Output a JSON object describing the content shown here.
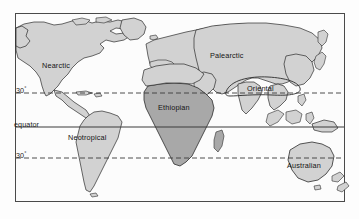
{
  "figure": {
    "kind": "world-map",
    "frame": {
      "x": 15,
      "y": 13,
      "width": 330,
      "height": 189
    }
  },
  "colors": {
    "page_background": "#ffffff",
    "frame_border": "#4a4a4a",
    "ocean": "#fcfcfc",
    "land_light": "#d2d2d2",
    "land_dark": "#a8a8a8",
    "coastline": "#2b2b2b",
    "latitude_line": "#3a3a3a",
    "equator_line": "#3a3a3a",
    "label_text": "#151515"
  },
  "latitude_lines": [
    {
      "id": "north-30",
      "label": "30",
      "degree_symbol": "°",
      "style": "dashed",
      "y": 93
    },
    {
      "id": "equator",
      "label": "equator",
      "degree_symbol": "",
      "style": "solid",
      "y": 127
    },
    {
      "id": "south-30",
      "label": "30",
      "degree_symbol": "°",
      "style": "dashed",
      "y": 158
    }
  ],
  "regions": [
    {
      "id": "nearctic",
      "label": "Nearctic",
      "x": 42,
      "y": 62,
      "shade": "light"
    },
    {
      "id": "palearctic",
      "label": "Palearctic",
      "x": 210,
      "y": 52,
      "shade": "light"
    },
    {
      "id": "oriental",
      "label": "Oriental",
      "x": 247,
      "y": 85,
      "shade": "light"
    },
    {
      "id": "ethiopian",
      "label": "Ethiopian",
      "x": 158,
      "y": 104,
      "shade": "dark"
    },
    {
      "id": "neotropical",
      "label": "Neotropical",
      "x": 68,
      "y": 134,
      "shade": "light"
    },
    {
      "id": "australian",
      "label": "Australian",
      "x": 287,
      "y": 162,
      "shade": "light"
    }
  ]
}
